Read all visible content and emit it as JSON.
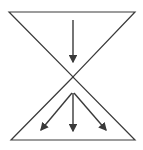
{
  "diagram": {
    "type": "hourglass-flow",
    "stroke_color": "#3a3a3a",
    "background": "#ffffff",
    "top_triangle": {
      "points": [
        [
          9,
          12
        ],
        [
          135,
          12
        ],
        [
          73,
          77
        ]
      ],
      "orientation": "inverted"
    },
    "bottom_triangle": {
      "points": [
        [
          73,
          77
        ],
        [
          11,
          140
        ],
        [
          135,
          140
        ]
      ],
      "orientation": "upright"
    },
    "arrows": [
      {
        "name": "converge-arrow",
        "from": [
          73,
          20
        ],
        "to": [
          73,
          62
        ]
      },
      {
        "name": "diverge-arrow-left",
        "from": [
          72,
          93
        ],
        "to": [
          41,
          130
        ]
      },
      {
        "name": "diverge-arrow-center",
        "from": [
          73,
          93
        ],
        "to": [
          73,
          131
        ]
      },
      {
        "name": "diverge-arrow-right",
        "from": [
          74,
          93
        ],
        "to": [
          106,
          130
        ]
      }
    ]
  }
}
